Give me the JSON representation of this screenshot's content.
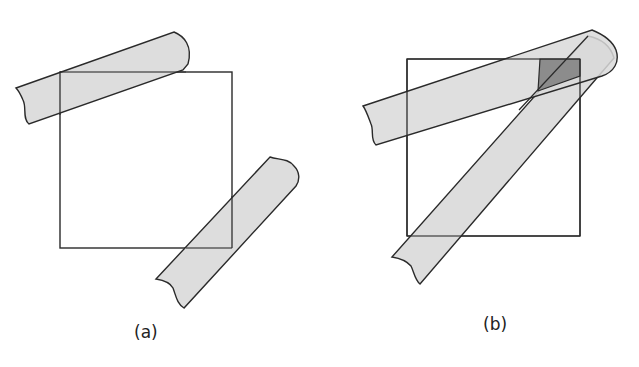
{
  "figure": {
    "panels": [
      {
        "id": "a",
        "label": "(a)",
        "description": "Square with two tape strips crossing opposite corners without overlapping each other"
      },
      {
        "id": "b",
        "label": "(b)",
        "description": "Square with two tape strips that overlap near the top-right corner, darker overlap region shaded"
      }
    ],
    "colors": {
      "strip_fill": "#d9d9d9",
      "overlap_fill": "#8c8c8c",
      "stroke": "#2a2a2a",
      "background": "#ffffff"
    }
  }
}
